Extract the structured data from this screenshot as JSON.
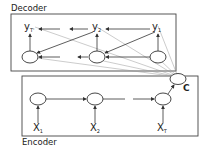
{
  "decoder": {
    "title": "Decoder",
    "outputs": [
      {
        "label": "y",
        "sub": "T'"
      },
      {
        "label": "y",
        "sub": "2"
      },
      {
        "label": "y",
        "sub": "1"
      }
    ]
  },
  "encoder": {
    "title": "Encoder",
    "inputs": [
      {
        "label": "X",
        "sub": "1"
      },
      {
        "label": "X",
        "sub": "2"
      },
      {
        "label": "X",
        "sub": "T"
      }
    ]
  },
  "context": {
    "label": "C"
  },
  "colors": {
    "stroke": "#333333",
    "thin": "#888888",
    "background": "#ffffff"
  }
}
